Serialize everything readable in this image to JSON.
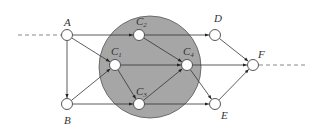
{
  "diagram": {
    "type": "directed-graph",
    "colors": {
      "region_fill": "#a6a6a6",
      "region_stroke": "#555555",
      "edge": "#333333",
      "node_fill": "#ffffff",
      "node_stroke": "#444444",
      "dashed": "#888888"
    },
    "region": {
      "label": "",
      "cx": 150,
      "cy": 67,
      "r": 51
    },
    "nodes": [
      {
        "id": "A",
        "label": "A",
        "sub": "",
        "x": 67,
        "y": 35,
        "lx": 64,
        "ly": 26
      },
      {
        "id": "B",
        "label": "B",
        "sub": "",
        "x": 67,
        "y": 104,
        "lx": 64,
        "ly": 124
      },
      {
        "id": "C1",
        "label": "C",
        "sub": "1",
        "x": 115,
        "y": 65,
        "lx": 111,
        "ly": 55
      },
      {
        "id": "C2",
        "label": "C",
        "sub": "2",
        "x": 139,
        "y": 35,
        "lx": 136,
        "ly": 25
      },
      {
        "id": "C3",
        "label": "C",
        "sub": "3",
        "x": 139,
        "y": 104,
        "lx": 136,
        "ly": 95
      },
      {
        "id": "C4",
        "label": "C",
        "sub": "4",
        "x": 187,
        "y": 65,
        "lx": 183,
        "ly": 55
      },
      {
        "id": "D",
        "label": "D",
        "sub": "",
        "x": 215,
        "y": 35,
        "lx": 214,
        "ly": 22
      },
      {
        "id": "E",
        "label": "E",
        "sub": "",
        "x": 215,
        "y": 104,
        "lx": 221,
        "ly": 119
      },
      {
        "id": "F",
        "label": "F",
        "sub": "",
        "x": 253,
        "y": 65,
        "lx": 258,
        "ly": 58
      }
    ],
    "edges": [
      {
        "from": "A",
        "to": "C2"
      },
      {
        "from": "A",
        "to": "C1"
      },
      {
        "from": "A",
        "to": "B"
      },
      {
        "from": "B",
        "to": "C1"
      },
      {
        "from": "B",
        "to": "C3"
      },
      {
        "from": "C2",
        "to": "D"
      },
      {
        "from": "C2",
        "to": "C4"
      },
      {
        "from": "C1",
        "to": "C4"
      },
      {
        "from": "C1",
        "to": "C3"
      },
      {
        "from": "C3",
        "to": "C4"
      },
      {
        "from": "C3",
        "to": "E"
      },
      {
        "from": "C4",
        "to": "F"
      },
      {
        "from": "C4",
        "to": "E"
      },
      {
        "from": "D",
        "to": "F"
      },
      {
        "from": "E",
        "to": "F"
      }
    ],
    "dashed_lines": [
      {
        "name": "incoming",
        "x1": 18,
        "y1": 35,
        "x2": 61,
        "y2": 35
      },
      {
        "name": "outgoing",
        "x1": 259,
        "y1": 65,
        "x2": 308,
        "y2": 65
      }
    ]
  }
}
